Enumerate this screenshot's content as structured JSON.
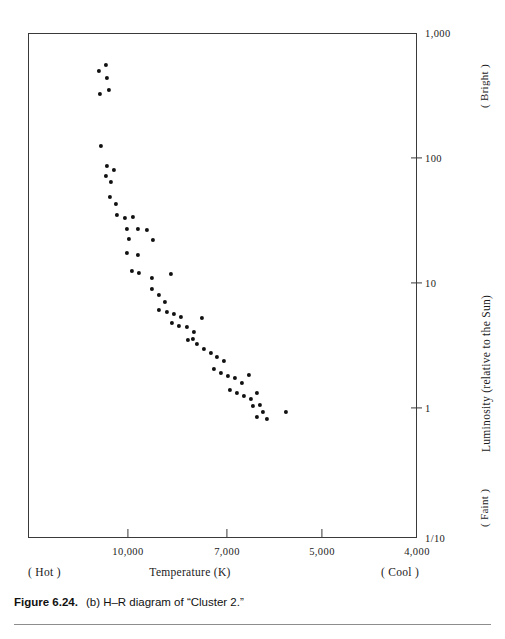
{
  "figure": {
    "caption_number": "Figure 6.24.",
    "caption_text": "(b) H–R diagram of “Cluster 2.”"
  },
  "axes": {
    "x_title": "Temperature (K)",
    "x_left_annotation": "( Hot )",
    "x_right_annotation": "( Cool )",
    "y_title": "Luminosity (relative to the Sun)",
    "y_top_annotation": "( Bright )",
    "y_bottom_annotation": "( Faint )"
  },
  "chart_data": {
    "type": "scatter",
    "title": "(b) H–R diagram of “Cluster 2.”",
    "xlabel": "Temperature (K)",
    "ylabel": "Luminosity (relative to the Sun)",
    "x_scale": "linear-reversed",
    "y_scale": "log",
    "xlim": [
      11500,
      4000
    ],
    "ylim": [
      0.1,
      1000
    ],
    "grid": false,
    "legend": null,
    "x_ticks": [
      {
        "value": 10000,
        "label": "10,000",
        "px": 128
      },
      {
        "value": 7000,
        "label": "7,000",
        "px": 227
      },
      {
        "value": 5000,
        "label": "5,000",
        "px": 322
      },
      {
        "value": 4000,
        "label": "4,000",
        "px": 417
      }
    ],
    "y_ticks": [
      {
        "value": 1000,
        "label": "1,000",
        "px": 33
      },
      {
        "value": 100,
        "label": "100",
        "px": 158
      },
      {
        "value": 10,
        "label": "10",
        "px": 283
      },
      {
        "value": 1,
        "label": "1",
        "px": 408
      },
      {
        "value": 0.1,
        "label": "1/10",
        "px": 538
      }
    ],
    "point_count": 62,
    "series": [
      {
        "name": "Cluster 2 stars",
        "marker": "filled-circle",
        "color": "#111111",
        "points": [
          {
            "px": 98,
            "py": 70,
            "temperature": 11130,
            "luminosity": 480
          },
          {
            "px": 105,
            "py": 64,
            "temperature": 10920,
            "luminosity": 560
          },
          {
            "px": 106,
            "py": 77,
            "temperature": 10890,
            "luminosity": 410
          },
          {
            "px": 108,
            "py": 89,
            "temperature": 10830,
            "luminosity": 330
          },
          {
            "px": 99,
            "py": 93,
            "temperature": 11100,
            "luminosity": 310
          },
          {
            "px": 100,
            "py": 145,
            "temperature": 11070,
            "luminosity": 125
          },
          {
            "px": 106,
            "py": 165,
            "temperature": 10890,
            "luminosity": 90
          },
          {
            "px": 113,
            "py": 169,
            "temperature": 10680,
            "luminosity": 83
          },
          {
            "px": 105,
            "py": 175,
            "temperature": 10920,
            "luminosity": 76
          },
          {
            "px": 110,
            "py": 181,
            "temperature": 10770,
            "luminosity": 70
          },
          {
            "px": 109,
            "py": 196,
            "temperature": 10800,
            "luminosity": 56
          },
          {
            "px": 115,
            "py": 203,
            "temperature": 10620,
            "luminosity": 50
          },
          {
            "px": 116,
            "py": 214,
            "temperature": 10590,
            "luminosity": 42
          },
          {
            "px": 124,
            "py": 217,
            "temperature": 10350,
            "luminosity": 40
          },
          {
            "px": 132,
            "py": 216,
            "temperature": 10110,
            "luminosity": 41
          },
          {
            "px": 126,
            "py": 228,
            "temperature": 10290,
            "luminosity": 33
          },
          {
            "px": 137,
            "py": 228,
            "temperature": 9960,
            "luminosity": 33
          },
          {
            "px": 146,
            "py": 229,
            "temperature": 9690,
            "luminosity": 32
          },
          {
            "px": 128,
            "py": 238,
            "temperature": 10230,
            "luminosity": 28
          },
          {
            "px": 152,
            "py": 239,
            "temperature": 9510,
            "luminosity": 27
          },
          {
            "px": 126,
            "py": 252,
            "temperature": 10290,
            "luminosity": 22
          },
          {
            "px": 137,
            "py": 254,
            "temperature": 9960,
            "luminosity": 21
          },
          {
            "px": 131,
            "py": 270,
            "temperature": 10140,
            "luminosity": 16
          },
          {
            "px": 138,
            "py": 272,
            "temperature": 9930,
            "luminosity": 15
          },
          {
            "px": 151,
            "py": 277,
            "temperature": 9540,
            "luminosity": 14
          },
          {
            "px": 170,
            "py": 273,
            "temperature": 8970,
            "luminosity": 15
          },
          {
            "px": 151,
            "py": 288,
            "temperature": 9540,
            "luminosity": 12
          },
          {
            "px": 158,
            "py": 294,
            "temperature": 9330,
            "luminosity": 11
          },
          {
            "px": 164,
            "py": 301,
            "temperature": 9150,
            "luminosity": 9.7
          },
          {
            "px": 158,
            "py": 309,
            "temperature": 9330,
            "luminosity": 8.6
          },
          {
            "px": 166,
            "py": 311,
            "temperature": 9090,
            "luminosity": 8.4
          },
          {
            "px": 173,
            "py": 313,
            "temperature": 8880,
            "luminosity": 8.2
          },
          {
            "px": 180,
            "py": 316,
            "temperature": 8670,
            "luminosity": 7.8
          },
          {
            "px": 171,
            "py": 322,
            "temperature": 8910,
            "luminosity": 7.1
          },
          {
            "px": 178,
            "py": 325,
            "temperature": 8700,
            "luminosity": 6.8
          },
          {
            "px": 186,
            "py": 326,
            "temperature": 8460,
            "luminosity": 6.7
          },
          {
            "px": 193,
            "py": 331,
            "temperature": 8250,
            "luminosity": 6.2
          },
          {
            "px": 201,
            "py": 317,
            "temperature": 8010,
            "luminosity": 7.7
          },
          {
            "px": 187,
            "py": 339,
            "temperature": 8430,
            "luminosity": 5.4
          },
          {
            "px": 196,
            "py": 343,
            "temperature": 8160,
            "luminosity": 5.1
          },
          {
            "px": 203,
            "py": 348,
            "temperature": 7950,
            "luminosity": 4.7
          },
          {
            "px": 210,
            "py": 352,
            "temperature": 7740,
            "luminosity": 4.4
          },
          {
            "px": 192,
            "py": 338,
            "temperature": 8280,
            "luminosity": 5.5
          },
          {
            "px": 216,
            "py": 356,
            "temperature": 7560,
            "luminosity": 4.1
          },
          {
            "px": 223,
            "py": 360,
            "temperature": 7350,
            "luminosity": 3.8
          },
          {
            "px": 213,
            "py": 368,
            "temperature": 7650,
            "luminosity": 3.3
          },
          {
            "px": 220,
            "py": 372,
            "temperature": 7440,
            "luminosity": 3.1
          },
          {
            "px": 227,
            "py": 375,
            "temperature": 7230,
            "luminosity": 2.9
          },
          {
            "px": 234,
            "py": 377,
            "temperature": 7020,
            "luminosity": 2.8
          },
          {
            "px": 241,
            "py": 382,
            "temperature": 6810,
            "luminosity": 2.5
          },
          {
            "px": 248,
            "py": 374,
            "temperature": 6610,
            "luminosity": 3.0
          },
          {
            "px": 229,
            "py": 389,
            "temperature": 7170,
            "luminosity": 2.2
          },
          {
            "px": 236,
            "py": 392,
            "temperature": 6960,
            "luminosity": 2.1
          },
          {
            "px": 243,
            "py": 395,
            "temperature": 6750,
            "luminosity": 1.9
          },
          {
            "px": 250,
            "py": 398,
            "temperature": 6540,
            "luminosity": 1.8
          },
          {
            "px": 256,
            "py": 392,
            "temperature": 6360,
            "luminosity": 2.1
          },
          {
            "px": 252,
            "py": 405,
            "temperature": 6480,
            "luminosity": 1.6
          },
          {
            "px": 259,
            "py": 404,
            "temperature": 6270,
            "luminosity": 1.6
          },
          {
            "px": 262,
            "py": 411,
            "temperature": 6180,
            "luminosity": 1.4
          },
          {
            "px": 256,
            "py": 416,
            "temperature": 6360,
            "luminosity": 1.2
          },
          {
            "px": 266,
            "py": 418,
            "temperature": 6060,
            "luminosity": 1.2
          },
          {
            "px": 285,
            "py": 411,
            "temperature": 5490,
            "luminosity": 1.4
          }
        ]
      }
    ]
  }
}
